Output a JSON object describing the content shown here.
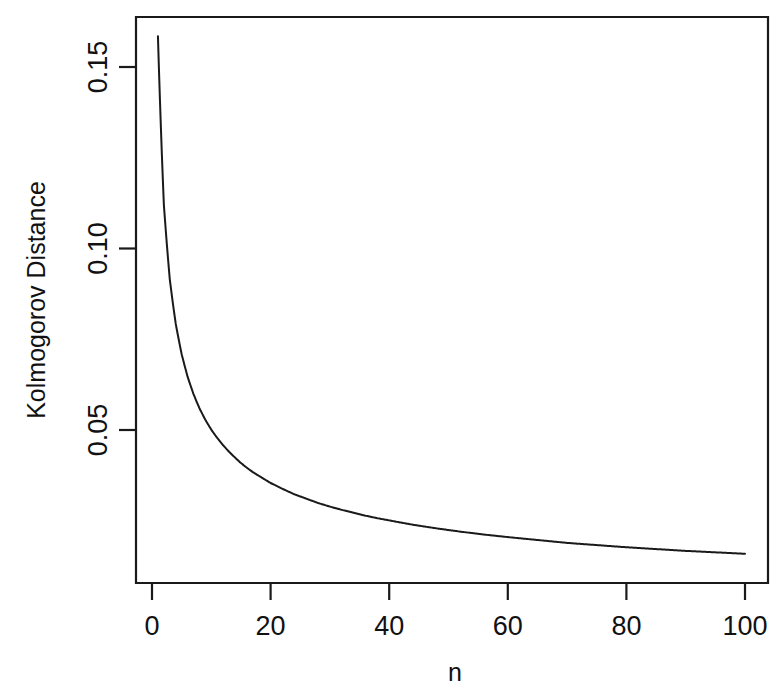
{
  "chart_data": {
    "type": "line",
    "title": "",
    "xlabel": "n",
    "ylabel": "Kolmogorov Distance",
    "xlim": [
      0,
      104
    ],
    "ylim": [
      0.0095,
      0.1655
    ],
    "xticks": [
      0,
      20,
      40,
      60,
      80,
      100
    ],
    "xticklabels": [
      "0",
      "20",
      "40",
      "60",
      "80",
      "100"
    ],
    "yticks": [
      0.05,
      0.1,
      0.15
    ],
    "yticklabels": [
      "0.05",
      "0.10",
      "0.15"
    ],
    "grid": false,
    "legend": null,
    "annotations": [],
    "series": [
      {
        "name": "Kolmogorov Distance",
        "color": "#1a1a1a",
        "x": [
          1,
          2,
          3,
          4,
          5,
          6,
          7,
          8,
          9,
          10,
          11,
          12,
          13,
          14,
          15,
          16,
          17,
          18,
          19,
          20,
          22,
          24,
          26,
          28,
          30,
          32,
          34,
          36,
          38,
          40,
          44,
          48,
          52,
          56,
          60,
          65,
          70,
          75,
          80,
          85,
          90,
          95,
          100
        ],
        "values": [
          0.1585,
          0.1121,
          0.0915,
          0.0793,
          0.0709,
          0.0647,
          0.0599,
          0.056,
          0.0528,
          0.0501,
          0.0478,
          0.0458,
          0.044,
          0.0424,
          0.0409,
          0.0396,
          0.0384,
          0.0374,
          0.0364,
          0.0354,
          0.0338,
          0.0323,
          0.0311,
          0.0299,
          0.0289,
          0.028,
          0.0272,
          0.0264,
          0.0257,
          0.0251,
          0.0239,
          0.0229,
          0.022,
          0.0212,
          0.0205,
          0.0197,
          0.0189,
          0.0183,
          0.0177,
          0.0172,
          0.0167,
          0.0163,
          0.0159
        ]
      }
    ]
  },
  "axes": {
    "y_title": "Kolmogorov Distance",
    "x_title": "n"
  }
}
